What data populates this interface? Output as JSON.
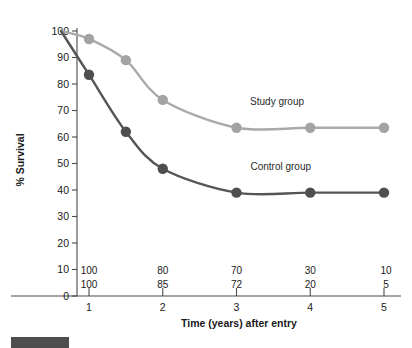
{
  "chart_data": {
    "type": "line",
    "title": "",
    "subtitle": "",
    "xlabel": "Time (years) after entry",
    "ylabel": "% Survival",
    "xlim": [
      0.55,
      5.2
    ],
    "ylim": [
      0,
      100
    ],
    "grid": false,
    "legend_position": "inline-annotations",
    "x_ticks": [
      "1",
      "2",
      "3",
      "4",
      "5"
    ],
    "x_tick_values": [
      1,
      2,
      3,
      4,
      5
    ],
    "y_ticks": [
      "0",
      "10",
      "20",
      "30",
      "40",
      "50",
      "60",
      "70",
      "80",
      "90",
      "100"
    ],
    "y_tick_values": [
      0,
      10,
      20,
      30,
      40,
      50,
      60,
      70,
      80,
      90,
      100
    ],
    "series": [
      {
        "name": "Study group",
        "color": "#a9a9a9",
        "marker_color": "#a3a3a3",
        "x": [
          0.62,
          1,
          1.5,
          2,
          3,
          4,
          5
        ],
        "values": [
          100,
          97,
          89,
          74,
          63.5,
          63.5,
          63.5
        ],
        "marker_x": [
          1,
          1.5,
          2,
          3,
          4,
          5
        ],
        "marker_values": [
          97,
          89,
          74,
          63.5,
          63.5,
          63.5
        ]
      },
      {
        "name": "Control group",
        "color": "#555555",
        "marker_color": "#4f4f4f",
        "x": [
          0.62,
          1,
          1.5,
          2,
          3,
          4,
          5
        ],
        "values": [
          100,
          83.5,
          62,
          48,
          39,
          39,
          39
        ],
        "marker_x": [
          1,
          1.5,
          2,
          3,
          4,
          5
        ],
        "marker_values": [
          83.5,
          62,
          48,
          39,
          39,
          39
        ]
      }
    ],
    "annotations": [
      {
        "text": "Study group",
        "x": 3.55,
        "y": 72
      },
      {
        "text": "Control group",
        "x": 3.6,
        "y": 47.5
      }
    ],
    "numbers_at_risk": {
      "rows": [
        {
          "group": "Study group",
          "values": [
            "100",
            "80",
            "70",
            "30",
            "10"
          ]
        },
        {
          "group": "Control group",
          "values": [
            "100",
            "85",
            "72",
            "20",
            "5"
          ]
        }
      ],
      "x_positions": [
        1,
        2,
        3,
        4,
        5
      ]
    }
  },
  "caption": {
    "bar_label": ""
  }
}
